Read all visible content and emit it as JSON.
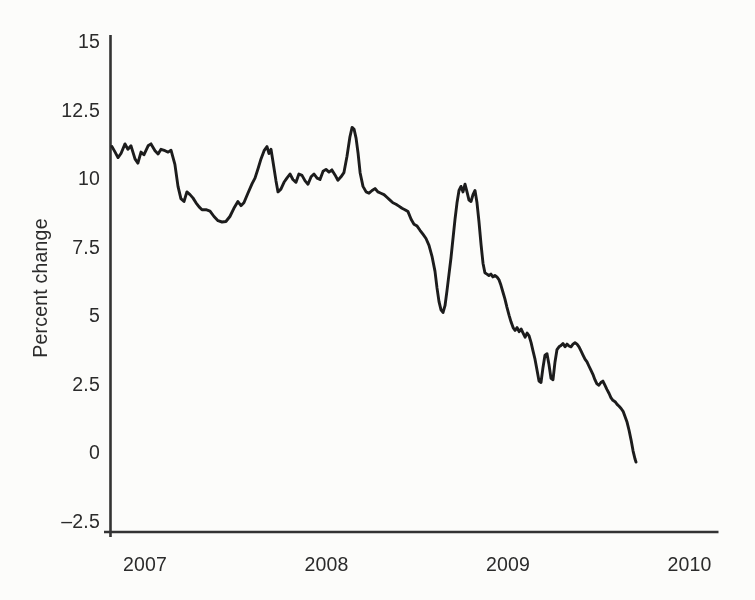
{
  "figure": {
    "background": "#fcfcfa"
  },
  "chart_data": {
    "type": "line",
    "title": "",
    "xlabel": "",
    "ylabel": "Percent change",
    "grid": false,
    "legend": null,
    "xlim": [
      2006.77,
      2010.16
    ],
    "ylim": [
      -2.9,
      15.2
    ],
    "line_color": "#1c1c1c",
    "axis_color": "#333333",
    "text_color": "#2b2b2b",
    "x_ticks": [
      {
        "value": 2007,
        "label": "2007"
      },
      {
        "value": 2008,
        "label": "2008"
      },
      {
        "value": 2009,
        "label": "2009"
      },
      {
        "value": 2010,
        "label": "2010"
      }
    ],
    "y_ticks": [
      {
        "value": -2.5,
        "label": "–2.5"
      },
      {
        "value": 0,
        "label": "0"
      },
      {
        "value": 2.5,
        "label": "2.5"
      },
      {
        "value": 5,
        "label": "5"
      },
      {
        "value": 7.5,
        "label": "7.5"
      },
      {
        "value": 10,
        "label": "10"
      },
      {
        "value": 12.5,
        "label": "12.5"
      },
      {
        "value": 15,
        "label": "15"
      }
    ],
    "series": [
      {
        "name": "percent-change",
        "points": [
          [
            2006.818,
            11.15
          ],
          [
            2006.835,
            10.95
          ],
          [
            2006.851,
            10.75
          ],
          [
            2006.868,
            10.9
          ],
          [
            2006.89,
            11.25
          ],
          [
            2006.906,
            11.05
          ],
          [
            2006.923,
            11.18
          ],
          [
            2006.945,
            10.7
          ],
          [
            2006.961,
            10.55
          ],
          [
            2006.978,
            10.95
          ],
          [
            2006.994,
            10.85
          ],
          [
            2007.017,
            11.18
          ],
          [
            2007.033,
            11.25
          ],
          [
            2007.055,
            11.0
          ],
          [
            2007.072,
            10.88
          ],
          [
            2007.088,
            11.05
          ],
          [
            2007.11,
            11.0
          ],
          [
            2007.127,
            10.95
          ],
          [
            2007.143,
            11.02
          ],
          [
            2007.165,
            10.5
          ],
          [
            2007.182,
            9.7
          ],
          [
            2007.198,
            9.25
          ],
          [
            2007.215,
            9.15
          ],
          [
            2007.231,
            9.5
          ],
          [
            2007.248,
            9.4
          ],
          [
            2007.264,
            9.28
          ],
          [
            2007.281,
            9.1
          ],
          [
            2007.298,
            8.95
          ],
          [
            2007.314,
            8.85
          ],
          [
            2007.336,
            8.85
          ],
          [
            2007.358,
            8.8
          ],
          [
            2007.38,
            8.6
          ],
          [
            2007.402,
            8.45
          ],
          [
            2007.424,
            8.4
          ],
          [
            2007.446,
            8.42
          ],
          [
            2007.468,
            8.6
          ],
          [
            2007.49,
            8.9
          ],
          [
            2007.512,
            9.15
          ],
          [
            2007.529,
            9.0
          ],
          [
            2007.545,
            9.1
          ],
          [
            2007.567,
            9.45
          ],
          [
            2007.59,
            9.8
          ],
          [
            2007.606,
            10.0
          ],
          [
            2007.623,
            10.35
          ],
          [
            2007.639,
            10.7
          ],
          [
            2007.656,
            11.0
          ],
          [
            2007.672,
            11.15
          ],
          [
            2007.683,
            10.9
          ],
          [
            2007.694,
            11.05
          ],
          [
            2007.705,
            10.6
          ],
          [
            2007.722,
            9.9
          ],
          [
            2007.733,
            9.5
          ],
          [
            2007.749,
            9.6
          ],
          [
            2007.766,
            9.85
          ],
          [
            2007.782,
            10.0
          ],
          [
            2007.799,
            10.15
          ],
          [
            2007.815,
            9.95
          ],
          [
            2007.832,
            9.85
          ],
          [
            2007.848,
            10.15
          ],
          [
            2007.865,
            10.1
          ],
          [
            2007.882,
            9.9
          ],
          [
            2007.898,
            9.78
          ],
          [
            2007.915,
            10.05
          ],
          [
            2007.931,
            10.15
          ],
          [
            2007.948,
            10.0
          ],
          [
            2007.964,
            9.95
          ],
          [
            2007.981,
            10.25
          ],
          [
            2007.997,
            10.32
          ],
          [
            2008.014,
            10.22
          ],
          [
            2008.03,
            10.3
          ],
          [
            2008.047,
            10.12
          ],
          [
            2008.063,
            9.92
          ],
          [
            2008.08,
            10.05
          ],
          [
            2008.096,
            10.2
          ],
          [
            2008.113,
            10.8
          ],
          [
            2008.129,
            11.5
          ],
          [
            2008.141,
            11.85
          ],
          [
            2008.152,
            11.78
          ],
          [
            2008.163,
            11.45
          ],
          [
            2008.174,
            10.9
          ],
          [
            2008.185,
            10.2
          ],
          [
            2008.201,
            9.7
          ],
          [
            2008.218,
            9.5
          ],
          [
            2008.234,
            9.45
          ],
          [
            2008.251,
            9.55
          ],
          [
            2008.267,
            9.62
          ],
          [
            2008.284,
            9.5
          ],
          [
            2008.3,
            9.45
          ],
          [
            2008.317,
            9.4
          ],
          [
            2008.333,
            9.3
          ],
          [
            2008.35,
            9.2
          ],
          [
            2008.366,
            9.1
          ],
          [
            2008.383,
            9.05
          ],
          [
            2008.399,
            8.98
          ],
          [
            2008.416,
            8.9
          ],
          [
            2008.432,
            8.85
          ],
          [
            2008.449,
            8.78
          ],
          [
            2008.466,
            8.5
          ],
          [
            2008.482,
            8.32
          ],
          [
            2008.499,
            8.25
          ],
          [
            2008.515,
            8.1
          ],
          [
            2008.532,
            7.95
          ],
          [
            2008.548,
            7.8
          ],
          [
            2008.565,
            7.55
          ],
          [
            2008.581,
            7.15
          ],
          [
            2008.598,
            6.6
          ],
          [
            2008.609,
            6.0
          ],
          [
            2008.62,
            5.5
          ],
          [
            2008.631,
            5.2
          ],
          [
            2008.642,
            5.1
          ],
          [
            2008.653,
            5.35
          ],
          [
            2008.664,
            5.9
          ],
          [
            2008.675,
            6.5
          ],
          [
            2008.686,
            7.1
          ],
          [
            2008.697,
            7.8
          ],
          [
            2008.708,
            8.5
          ],
          [
            2008.719,
            9.1
          ],
          [
            2008.73,
            9.55
          ],
          [
            2008.741,
            9.7
          ],
          [
            2008.752,
            9.5
          ],
          [
            2008.763,
            9.78
          ],
          [
            2008.774,
            9.5
          ],
          [
            2008.785,
            9.2
          ],
          [
            2008.796,
            9.15
          ],
          [
            2008.807,
            9.4
          ],
          [
            2008.818,
            9.55
          ],
          [
            2008.829,
            9.1
          ],
          [
            2008.84,
            8.4
          ],
          [
            2008.851,
            7.6
          ],
          [
            2008.862,
            6.9
          ],
          [
            2008.873,
            6.55
          ],
          [
            2008.884,
            6.5
          ],
          [
            2008.895,
            6.45
          ],
          [
            2008.906,
            6.5
          ],
          [
            2008.917,
            6.4
          ],
          [
            2008.928,
            6.45
          ],
          [
            2008.939,
            6.4
          ],
          [
            2008.95,
            6.3
          ],
          [
            2008.961,
            6.1
          ],
          [
            2008.972,
            5.85
          ],
          [
            2008.983,
            5.6
          ],
          [
            2008.994,
            5.3
          ],
          [
            2009.006,
            5.0
          ],
          [
            2009.017,
            4.75
          ],
          [
            2009.028,
            4.55
          ],
          [
            2009.039,
            4.45
          ],
          [
            2009.05,
            4.55
          ],
          [
            2009.061,
            4.4
          ],
          [
            2009.072,
            4.5
          ],
          [
            2009.083,
            4.35
          ],
          [
            2009.094,
            4.2
          ],
          [
            2009.105,
            4.35
          ],
          [
            2009.116,
            4.25
          ],
          [
            2009.127,
            4.0
          ],
          [
            2009.138,
            3.7
          ],
          [
            2009.149,
            3.4
          ],
          [
            2009.16,
            3.0
          ],
          [
            2009.171,
            2.6
          ],
          [
            2009.182,
            2.55
          ],
          [
            2009.193,
            3.1
          ],
          [
            2009.204,
            3.55
          ],
          [
            2009.215,
            3.6
          ],
          [
            2009.226,
            3.2
          ],
          [
            2009.237,
            2.7
          ],
          [
            2009.248,
            2.65
          ],
          [
            2009.259,
            3.3
          ],
          [
            2009.27,
            3.75
          ],
          [
            2009.281,
            3.85
          ],
          [
            2009.292,
            3.9
          ],
          [
            2009.303,
            3.97
          ],
          [
            2009.314,
            3.85
          ],
          [
            2009.325,
            3.95
          ],
          [
            2009.336,
            3.88
          ],
          [
            2009.347,
            3.85
          ],
          [
            2009.358,
            3.95
          ],
          [
            2009.369,
            4.0
          ],
          [
            2009.38,
            3.95
          ],
          [
            2009.391,
            3.85
          ],
          [
            2009.402,
            3.7
          ],
          [
            2009.413,
            3.55
          ],
          [
            2009.424,
            3.4
          ],
          [
            2009.435,
            3.3
          ],
          [
            2009.446,
            3.15
          ],
          [
            2009.457,
            3.0
          ],
          [
            2009.468,
            2.85
          ],
          [
            2009.479,
            2.65
          ],
          [
            2009.49,
            2.5
          ],
          [
            2009.501,
            2.45
          ],
          [
            2009.512,
            2.55
          ],
          [
            2009.523,
            2.6
          ],
          [
            2009.534,
            2.45
          ],
          [
            2009.545,
            2.3
          ],
          [
            2009.557,
            2.15
          ],
          [
            2009.567,
            2.0
          ],
          [
            2009.578,
            1.9
          ],
          [
            2009.59,
            1.85
          ],
          [
            2009.601,
            1.75
          ],
          [
            2009.612,
            1.68
          ],
          [
            2009.623,
            1.6
          ],
          [
            2009.634,
            1.5
          ],
          [
            2009.645,
            1.3
          ],
          [
            2009.656,
            1.1
          ],
          [
            2009.667,
            0.8
          ],
          [
            2009.678,
            0.45
          ],
          [
            2009.689,
            0.05
          ],
          [
            2009.7,
            -0.25
          ],
          [
            2009.705,
            -0.35
          ]
        ]
      }
    ]
  }
}
